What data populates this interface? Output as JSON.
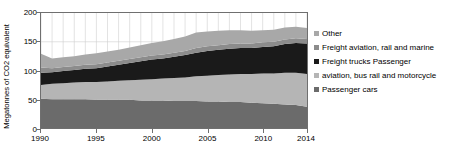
{
  "chart_data": {
    "type": "area",
    "stacked": true,
    "title": "",
    "xlabel": "",
    "ylabel": "Megatonnes of CO2 equivalent",
    "xlim": [
      1990,
      2014
    ],
    "ylim": [
      0,
      200
    ],
    "yticks": [
      0,
      50,
      100,
      150,
      200
    ],
    "xticks": [
      1990,
      1995,
      2000,
      2005,
      2010,
      2014
    ],
    "grid": "vertical-yearly",
    "legend_position": "right",
    "x": [
      1990,
      1991,
      1992,
      1993,
      1994,
      1995,
      1996,
      1997,
      1998,
      1999,
      2000,
      2001,
      2002,
      2003,
      2004,
      2005,
      2006,
      2007,
      2008,
      2009,
      2010,
      2011,
      2012,
      2013,
      2014
    ],
    "series": [
      {
        "name": "Passenger cars",
        "color": "#6b6b6b",
        "values": [
          51,
          50,
          50,
          50,
          50,
          49,
          49,
          49,
          49,
          48,
          48,
          48,
          47,
          47,
          47,
          46,
          46,
          45,
          45,
          44,
          43,
          42,
          41,
          40,
          37
        ]
      },
      {
        "name": "aviation, bus rail and motorcycle",
        "color": "#b5b5b5",
        "values": [
          24,
          27,
          28,
          29,
          30,
          31,
          32,
          33,
          34,
          36,
          37,
          38,
          40,
          41,
          43,
          45,
          46,
          48,
          49,
          50,
          52,
          53,
          55,
          56,
          57
        ]
      },
      {
        "name": "Freight trucks Passenger",
        "color": "#1a1a1a",
        "values": [
          21,
          20,
          21,
          22,
          23,
          24,
          26,
          28,
          30,
          32,
          34,
          35,
          37,
          39,
          41,
          43,
          44,
          45,
          45,
          45,
          46,
          47,
          50,
          52,
          53
        ]
      },
      {
        "name": "Freight aviation, rail and marine",
        "color": "#8c8c8c",
        "values": [
          9,
          7,
          7,
          7,
          7,
          7,
          7,
          7,
          7,
          7,
          7,
          7,
          7,
          7,
          8,
          8,
          8,
          8,
          8,
          8,
          8,
          8,
          8,
          8,
          8
        ]
      },
      {
        "name": "Other",
        "color": "#a8a8a8",
        "values": [
          24,
          17,
          17,
          17,
          18,
          19,
          19,
          19,
          20,
          21,
          22,
          23,
          24,
          25,
          27,
          26,
          25,
          24,
          23,
          22,
          21,
          21,
          21,
          20,
          19
        ]
      }
    ]
  },
  "legend": {
    "items": [
      {
        "label": "Other",
        "color": "#a8a8a8"
      },
      {
        "label": "Freight aviation, rail and marine",
        "color": "#8c8c8c"
      },
      {
        "label": "Freight trucks Passenger",
        "color": "#1a1a1a"
      },
      {
        "label": "aviation, bus rail and motorcycle",
        "color": "#b5b5b5"
      },
      {
        "label": "Passenger cars",
        "color": "#6b6b6b"
      }
    ]
  },
  "axes": {
    "y_title": "Megatonnes of CO2 equivalent",
    "y_tick_labels": [
      "200",
      "150",
      "100",
      "50",
      "0"
    ],
    "x_tick_labels": [
      "1990",
      "1995",
      "2000",
      "2005",
      "2010",
      "2014"
    ]
  },
  "colors": {
    "frame": "#6f6f6f",
    "gridline": "#d0d0d0",
    "text": "#000000",
    "background": "#ffffff"
  }
}
